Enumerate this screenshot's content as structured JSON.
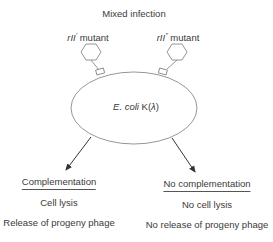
{
  "title": "Mixed infection",
  "phages": [
    {
      "gene": "rII",
      "superscript": "'",
      "suffix": " mutant"
    },
    {
      "gene": "rII",
      "superscript": "\"",
      "suffix": " mutant"
    }
  ],
  "cell": {
    "species": "E. coli",
    "strain": " K(",
    "lambda": "λ",
    "close": ")"
  },
  "outcomes": [
    {
      "heading": "Complementation",
      "line1": "Cell lysis",
      "line2": "Release of progeny phage"
    },
    {
      "heading": "No complementation",
      "line1": "No cell lysis",
      "line2": "No release of progeny phage"
    }
  ],
  "colors": {
    "stroke": "#7a7a7a",
    "arrow": "#333333",
    "text": "#3a3a3a"
  }
}
